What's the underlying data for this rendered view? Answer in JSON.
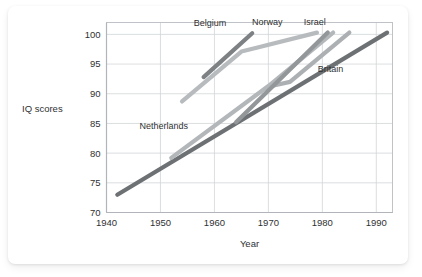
{
  "figure": {
    "background_color": "#ffffff",
    "card_color": "#ffffff"
  },
  "chart_data": {
    "type": "line",
    "title": "",
    "xlabel": "Year",
    "ylabel": "IQ scores",
    "xlim": [
      1940,
      1993
    ],
    "ylim": [
      70,
      102
    ],
    "xticks": [
      1940,
      1950,
      1960,
      1970,
      1980,
      1990
    ],
    "xticklabels": [
      "1940",
      "1950",
      "1960",
      "1970",
      "1980",
      "1990"
    ],
    "yticks": [
      70,
      75,
      80,
      85,
      90,
      95,
      100
    ],
    "yticklabels": [
      "70",
      "75",
      "80",
      "85",
      "90",
      "95",
      "100"
    ],
    "grid": true,
    "legend": "inline-labels",
    "series": [
      {
        "name": "Britain",
        "color": "#6e7174",
        "linewidth": 4.2,
        "label_x": 1981.5,
        "label_y": 93.6,
        "points": [
          {
            "x": 1942,
            "y": 73.0
          },
          {
            "x": 1992,
            "y": 100.3
          }
        ]
      },
      {
        "name": "Netherlands",
        "color": "#b4b7ba",
        "linewidth": 4.2,
        "label_x": 1950.6,
        "label_y": 84.0,
        "points": [
          {
            "x": 1952,
            "y": 79.2
          },
          {
            "x": 1970,
            "y": 91.3
          },
          {
            "x": 1982,
            "y": 100.3
          }
        ]
      },
      {
        "name": "Belgium",
        "color": "#7e8184",
        "linewidth": 4.2,
        "label_x": 1959.2,
        "label_y": 101.4,
        "points": [
          {
            "x": 1958,
            "y": 92.8
          },
          {
            "x": 1967,
            "y": 100.2
          }
        ]
      },
      {
        "name": "Norway",
        "color": "#b8bbbe",
        "linewidth": 4.2,
        "label_x": 1969.8,
        "label_y": 101.5,
        "points": [
          {
            "x": 1954,
            "y": 88.7
          },
          {
            "x": 1965,
            "y": 97.1
          },
          {
            "x": 1968,
            "y": 97.8
          },
          {
            "x": 1979,
            "y": 100.3
          }
        ]
      },
      {
        "name": "Israel",
        "color": "#adb0b3",
        "linewidth": 4.2,
        "label_x": 1978.6,
        "label_y": 101.6,
        "points": [
          {
            "x": 1971,
            "y": 91.4
          },
          {
            "x": 1974,
            "y": 92.0
          },
          {
            "x": 1985,
            "y": 100.3
          }
        ]
      },
      {
        "name": "Unlabelled-mid",
        "color": "#949799",
        "linewidth": 4.2,
        "label_x": null,
        "label_y": null,
        "points": [
          {
            "x": 1964,
            "y": 85.2
          },
          {
            "x": 1981,
            "y": 100.3
          }
        ]
      }
    ]
  }
}
